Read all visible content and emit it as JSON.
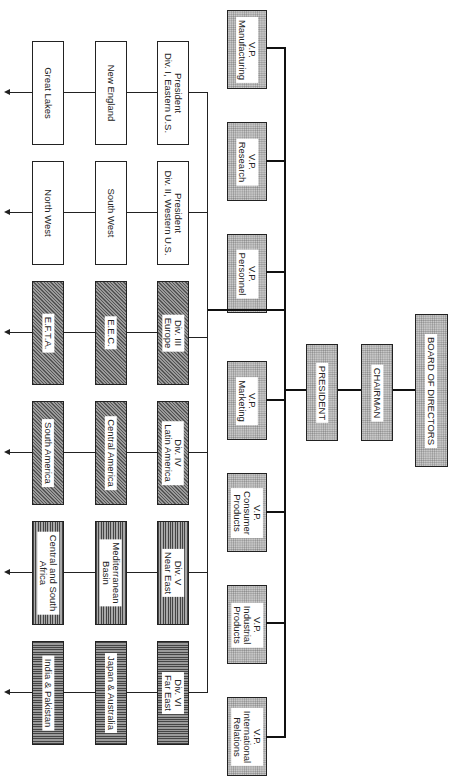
{
  "chart": {
    "orientation": "rotated 90 degrees clockwise",
    "top": {
      "board": "BOARD OF DIRECTORS",
      "chairman": "CHAIRMAN",
      "president": "PRESIDENT"
    },
    "vice_presidents": [
      {
        "label": "V.P.\nManufacturing"
      },
      {
        "label": "V.P.\nResearch"
      },
      {
        "label": "V.P.\nPersonnel"
      },
      {
        "label": "V.P.\nMarketing"
      },
      {
        "label": "V.P.\nConsumer\nProducts"
      },
      {
        "label": "V.P.\nIndustrial\nProducts"
      },
      {
        "label": "V.P.\nInternational\nRelations"
      }
    ],
    "divisions": [
      {
        "label": "President\nDiv. I, Eastern U.S.",
        "pattern": "plain",
        "regions": [
          "New England",
          "Great Lakes"
        ]
      },
      {
        "label": "President\nDiv. II, Western U.S.",
        "pattern": "plain",
        "regions": [
          "South West",
          "North West"
        ]
      },
      {
        "label": "Div. III\nEurope",
        "pattern": "diagonal",
        "regions": [
          "E.E.C.",
          "E.F.T.A."
        ]
      },
      {
        "label": "Div. IV\nLatin America",
        "pattern": "diagonal",
        "regions": [
          "Central America",
          "South America"
        ]
      },
      {
        "label": "Div. V\nNear East",
        "pattern": "horizontal-lines",
        "regions": [
          "Mediterranean\nBasin",
          "Central and South\nAfrica"
        ]
      },
      {
        "label": "Div. VI\nFar East",
        "pattern": "vertical-lines",
        "regions": [
          "Japan & Australia",
          "India & Pakistan"
        ]
      }
    ]
  }
}
